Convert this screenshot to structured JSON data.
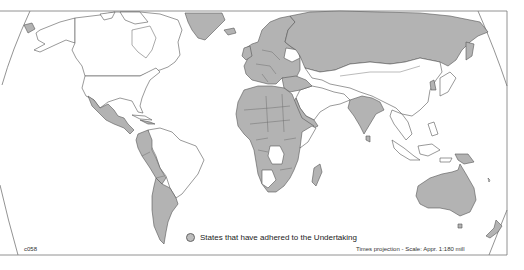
{
  "map": {
    "projection": "Times projection",
    "scale_label": "Times projection - Scale: Appr. 1:180 mill",
    "code": "c058",
    "colors": {
      "shaded_fill": "#bdbdbd",
      "hatch_line": "#9a9a9a",
      "outline": "#555555",
      "background": "#ffffff"
    },
    "legend": {
      "items": [
        {
          "label": "States that have adhered to the Undertaking",
          "swatch": "shaded-circle"
        }
      ]
    },
    "regions": {
      "shaded": [
        "Greenland",
        "Iceland",
        "Russia",
        "Europe (most)",
        "Turkey",
        "Middle East (part)",
        "India",
        "Bangladesh",
        "Mexico",
        "Central America",
        "Caribbean (part)",
        "Colombia",
        "Ecuador",
        "Peru",
        "Bolivia",
        "Chile",
        "Argentina",
        "Paraguay",
        "Uruguay",
        "North & West Africa",
        "Central Africa (most)",
        "East Africa (most)",
        "Southern Africa (part)",
        "Madagascar",
        "Papua New Guinea",
        "Australia",
        "New Zealand",
        "Japan"
      ],
      "unshaded": [
        "Canada",
        "United States",
        "Alaska",
        "Brazil",
        "Venezuela",
        "Guyana",
        "China",
        "Mongolia",
        "Kazakhstan (Central Asia)",
        "Iran",
        "Afghanistan",
        "Saudi Arabia",
        "Southeast Asia",
        "Indonesia",
        "Philippines",
        "Namibia",
        "Botswana",
        "Angola",
        "DR Congo",
        "Somalia"
      ]
    }
  }
}
